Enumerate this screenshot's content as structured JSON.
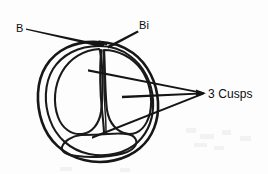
{
  "figure": {
    "background_color": "#fdfdfd",
    "line_color": "#171717"
  },
  "labels": {
    "b": {
      "text": "B",
      "x": 16,
      "y": 32
    },
    "bi": {
      "text": "Bi",
      "x": 139,
      "y": 29
    },
    "cusps": {
      "text": "3 Cusps",
      "x": 208,
      "y": 98
    }
  },
  "leaders": [
    {
      "name": "leader-b",
      "from_label": "B",
      "points": "26,29 98,45"
    },
    {
      "name": "leader-bi",
      "from_label": "Bi",
      "points": "137,31 108,47"
    },
    {
      "name": "leader-cusp-top",
      "from_label": "3 Cusps",
      "points": "88,70 203,92"
    },
    {
      "name": "leader-cusp-middle",
      "from_label": "3 Cusps",
      "points": "122,97 203,93"
    },
    {
      "name": "leader-cusp-bottom",
      "from_label": "3 Cusps",
      "points": "92,138 203,94"
    }
  ],
  "anatomy": {
    "outer_wall": "outer ring of the valve",
    "inner_wall": "inner ring of the valve",
    "cusp_count": 3,
    "cusp_names": [
      "left cusp",
      "right cusp",
      "bottom cusp"
    ],
    "nodule": "commissural nodule at top"
  }
}
